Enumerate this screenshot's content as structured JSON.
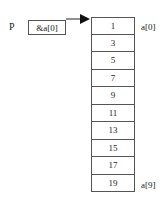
{
  "pointer": {
    "name": "P",
    "value": "&a[0]"
  },
  "array": {
    "cells": [
      "1",
      "3",
      "5",
      "7",
      "9",
      "11",
      "13",
      "15",
      "17",
      "19"
    ],
    "first_index_label": "a[0]",
    "last_index_label": "a[9]"
  }
}
